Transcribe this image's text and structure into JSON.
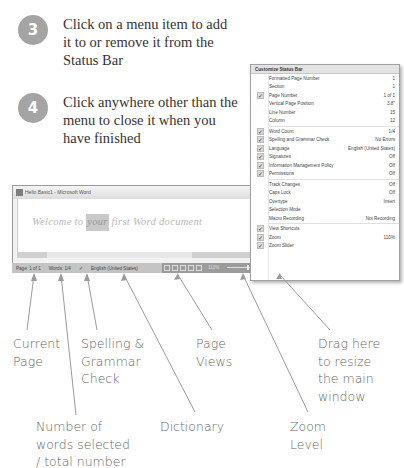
{
  "steps": [
    {
      "number": "3",
      "text": "Click on a menu item to add it to or remove it from the Status Bar"
    },
    {
      "number": "4",
      "text": "Click anywhere other than the menu to close it when you have finished"
    }
  ],
  "word_window": {
    "title": "Hello Basic1 - Microsoft Word",
    "document_text_before": "Welcome to ",
    "document_text_selected": "your",
    "document_text_after": " first Word document"
  },
  "status_bar": {
    "page": "Page: 1 of 1",
    "words": "Words: 1/4",
    "language": "English (United States)",
    "zoom": "110%"
  },
  "menu": {
    "title": "Customize Status Bar",
    "items": [
      {
        "label": "Formatted Page Number",
        "value": "1",
        "checked": false
      },
      {
        "label": "Section",
        "value": "1",
        "checked": false
      },
      {
        "label": "Page Number",
        "value": "1 of 1",
        "checked": true
      },
      {
        "label": "Vertical Page Position",
        "value": "3.8\"",
        "checked": false
      },
      {
        "label": "Line Number",
        "value": "15",
        "checked": false
      },
      {
        "label": "Column",
        "value": "12",
        "checked": false
      },
      {
        "label": "Word Count",
        "value": "1/4",
        "checked": true
      },
      {
        "label": "Spelling and Grammar Check",
        "value": "No Errors",
        "checked": true
      },
      {
        "label": "Language",
        "value": "English (United States)",
        "checked": true
      },
      {
        "label": "Signatures",
        "value": "Off",
        "checked": true
      },
      {
        "label": "Information Management Policy",
        "value": "Off",
        "checked": true
      },
      {
        "label": "Permissions",
        "value": "Off",
        "checked": true
      },
      {
        "label": "Track Changes",
        "value": "Off",
        "checked": false
      },
      {
        "label": "Caps Lock",
        "value": "Off",
        "checked": false
      },
      {
        "label": "Overtype",
        "value": "Insert",
        "checked": false
      },
      {
        "label": "Selection Mode",
        "value": "",
        "checked": false
      },
      {
        "label": "Macro Recording",
        "value": "Not Recording",
        "checked": false
      },
      {
        "label": "View Shortcuts",
        "value": "",
        "checked": true
      },
      {
        "label": "Zoom",
        "value": "110%",
        "checked": true
      },
      {
        "label": "Zoom Slider",
        "value": "",
        "checked": true
      }
    ]
  },
  "callouts": {
    "current_page": [
      "Current",
      "Page"
    ],
    "words": [
      "Number of",
      "words selected",
      "/ total number"
    ],
    "spelling": [
      "Spelling &",
      "Grammar",
      "Check"
    ],
    "dictionary": [
      "Dictionary"
    ],
    "page_views": [
      "Page",
      "Views"
    ],
    "zoom_level": [
      "Zoom",
      "Level"
    ],
    "resize": [
      "Drag here",
      "to resize",
      "the main",
      "window"
    ]
  },
  "colors": {
    "step_badge": "#a4a4a4",
    "callout_text": "#666666",
    "arrow": "#9a9a9a"
  }
}
